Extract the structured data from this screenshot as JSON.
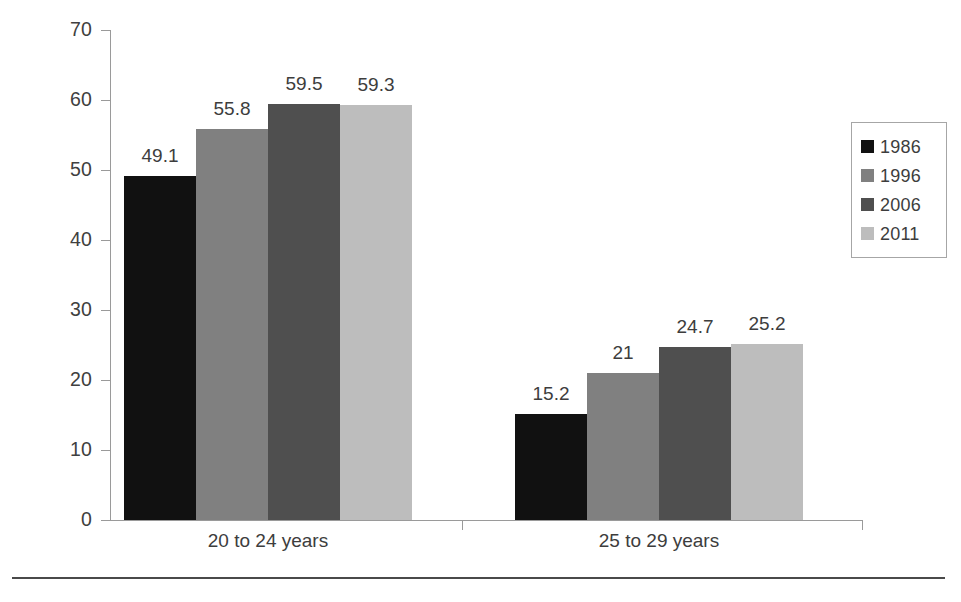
{
  "chart_data": {
    "type": "bar",
    "title": "",
    "subtitle": "",
    "xlabel": "",
    "ylabel": "",
    "categories": [
      "20 to 24 years",
      "25 to 29 years"
    ],
    "series": [
      {
        "name": "1986",
        "color": "#111111",
        "values": [
          49.1,
          15.2
        ],
        "labels": [
          "49.1",
          "15.2"
        ]
      },
      {
        "name": "1996",
        "color": "#808080",
        "values": [
          55.8,
          21
        ],
        "labels": [
          "55.8",
          "21"
        ]
      },
      {
        "name": "2006",
        "color": "#4f4f4f",
        "values": [
          59.5,
          24.7
        ],
        "labels": [
          "59.5",
          "24.7"
        ]
      },
      {
        "name": "2011",
        "color": "#bdbdbd",
        "values": [
          59.3,
          25.2
        ],
        "labels": [
          "59.3",
          "25.2"
        ]
      }
    ],
    "ylim": [
      0,
      70
    ],
    "ytick_labels": [
      "70",
      "60",
      "50",
      "40",
      "30",
      "20",
      "10",
      "0"
    ],
    "ytick_values": [
      70,
      60,
      50,
      40,
      30,
      20,
      10,
      0
    ],
    "grid": false,
    "legend_position": "right",
    "legend_entries": [
      "1986",
      "1996",
      "2006",
      "2011"
    ],
    "axis_color": "#9a9a9a",
    "text_color": "#3d3d3d"
  }
}
